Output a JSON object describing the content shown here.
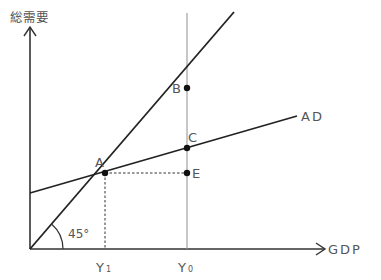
{
  "diagram": {
    "type": "keynesian-cross",
    "y_axis_label": "総需要",
    "x_axis_label": "GDP",
    "line_labels": {
      "aggregate_demand": "AD"
    },
    "angle_label": "45°",
    "points": [
      {
        "name": "A",
        "x": 105,
        "y": 173
      },
      {
        "name": "B",
        "x": 187,
        "y": 88
      },
      {
        "name": "C",
        "x": 187,
        "y": 148
      },
      {
        "name": "E",
        "x": 187,
        "y": 173
      }
    ],
    "x_ticks": [
      {
        "label": "Y",
        "sub": "1",
        "x": 105
      },
      {
        "label": "Y",
        "sub": "0",
        "x": 187
      }
    ],
    "colors": {
      "line": "#222222",
      "guide": "#999999",
      "text": "#555555"
    }
  }
}
